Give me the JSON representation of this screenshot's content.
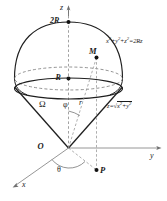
{
  "figure": {
    "kind": "3d-geometry-diagram",
    "background_color": "#ffffff",
    "line_color": "#1a1a1a",
    "axis_color": "#7a7a7a",
    "dash_color": "#9a9a9a",
    "axes": [
      {
        "name": "z-axis",
        "label": "z",
        "direction": "up"
      },
      {
        "name": "y-axis",
        "label": "y",
        "direction": "right"
      },
      {
        "name": "x-axis",
        "label": "x",
        "direction": "lower-left"
      }
    ],
    "points": [
      {
        "name": "origin",
        "label": "O"
      },
      {
        "name": "sphere-top",
        "label": "2R"
      },
      {
        "name": "sphere-center",
        "label": "R"
      },
      {
        "name": "point-m",
        "label": "M"
      },
      {
        "name": "point-p",
        "label": "P"
      }
    ],
    "angles": [
      {
        "name": "polar-angle",
        "label": "φ"
      },
      {
        "name": "azimuth-angle",
        "label": "θ"
      }
    ],
    "segments": [
      {
        "name": "radius-r",
        "label": "r"
      }
    ],
    "regions": [
      {
        "name": "solid-region",
        "label": "Ω"
      }
    ],
    "equations": {
      "sphere": {
        "name": "sphere-equation",
        "parts": [
          "x",
          "2",
          "+y",
          "2",
          "+z",
          "2",
          "=2Rz"
        ],
        "plain": "x²+y²+z²=2Rz"
      },
      "cone": {
        "name": "cone-equation",
        "prefix": "z=",
        "radicand_base": "x",
        "radicand_mid": "+y",
        "plain": "z=√(x²+y²)"
      }
    }
  }
}
